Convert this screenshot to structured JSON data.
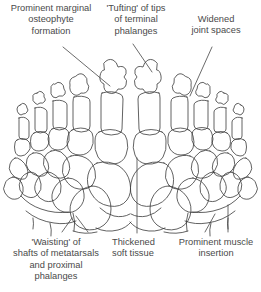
{
  "figure": {
    "ink_color": "#3a3a3a",
    "text_color": "#4a4a4a",
    "background": "#ffffff"
  },
  "annotations": {
    "osteophyte": "Prominent marginal\nosteophyte\nformation",
    "tufting": "'Tufting' of tips\nof terminal\nphalanges",
    "widened": "Widened\njoint spaces",
    "waisting": "'Waisting' of\nshafts of metatarsals\nand proximal\nphalanges",
    "thickened": "Thickened\nsoft tissue",
    "muscle": "Prominent muscle\ninsertion"
  }
}
